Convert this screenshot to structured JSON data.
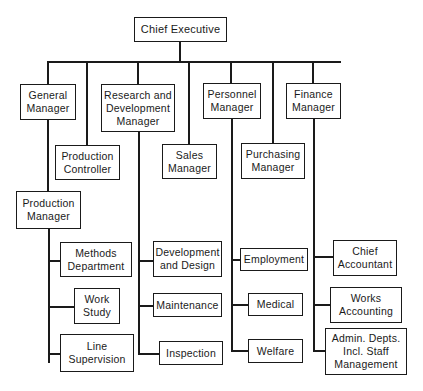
{
  "diagram": {
    "type": "organization-chart",
    "root": {
      "label": "Chief Executive"
    },
    "managers": [
      {
        "id": "general",
        "label": "General\nManager"
      },
      {
        "id": "rnd",
        "label": "Research and\nDevelopment\nManager"
      },
      {
        "id": "personnel",
        "label": "Personnel\nManager"
      },
      {
        "id": "finance",
        "label": "Finance\nManager"
      }
    ],
    "second_level": {
      "production_controller": "Production\nController",
      "sales_manager": "Sales\nManager",
      "purchasing_manager": "Purchasing\nManager",
      "production_manager": "Production\nManager"
    },
    "production_units": [
      "Methods\nDepartment",
      "Work\nStudy",
      "Line\nSupervision"
    ],
    "rnd_units": [
      "Development\nand Design",
      "Maintenance",
      "Inspection"
    ],
    "personnel_units": [
      "Employment",
      "Medical",
      "Welfare"
    ],
    "finance_units": [
      "Chief\nAccountant",
      "Works\nAccounting",
      "Admin. Depts.\nIncl. Staff\nManagement"
    ],
    "colors": {
      "line": "#1a1a1a",
      "background": "#ffffff"
    }
  }
}
